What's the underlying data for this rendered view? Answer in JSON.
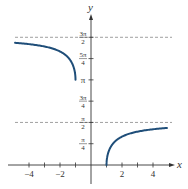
{
  "chart_data": {
    "type": "line",
    "title": "",
    "xlabel": "x",
    "ylabel": "y",
    "xlim": [
      -5.1,
      5.2
    ],
    "ylim": [
      0,
      5.1
    ],
    "grid": false,
    "x_ticks": [
      -4,
      -3,
      -2,
      -1,
      1,
      2,
      3,
      4
    ],
    "x_tick_labels": [
      {
        "value": -4,
        "text": "−4"
      },
      {
        "value": -2,
        "text": "−2"
      },
      {
        "value": 2,
        "text": "2"
      },
      {
        "value": 4,
        "text": "4"
      }
    ],
    "y_ticks": [
      {
        "value": 0.7854,
        "num": "π",
        "den": "4"
      },
      {
        "value": 1.5708,
        "num": "π",
        "den": "2"
      },
      {
        "value": 2.3562,
        "num": "3π",
        "den": "4"
      },
      {
        "value": 3.1416,
        "num": "π",
        "den": ""
      },
      {
        "value": 3.927,
        "num": "5π",
        "den": "4"
      },
      {
        "value": 4.7124,
        "num": "3π",
        "den": "2"
      }
    ],
    "asymptotes": [
      {
        "y": 4.7124,
        "label": "3π/2"
      },
      {
        "y": 1.5708,
        "label": "π/2"
      }
    ],
    "series": [
      {
        "name": "left branch (x ≤ −1)",
        "function": "2π − arccos(1/x)",
        "x_range": [
          -4.9,
          -1
        ],
        "points": [
          [
            -4.9,
            4.507
          ],
          [
            -4,
            4.459
          ],
          [
            -3,
            4.372
          ],
          [
            -2,
            4.189
          ],
          [
            -1.5,
            4.013
          ],
          [
            -1.2,
            3.728
          ],
          [
            -1.05,
            3.451
          ],
          [
            -1,
            3.1416
          ]
        ]
      },
      {
        "name": "right branch (x ≥ 1)",
        "function": "arccos(1/x)",
        "x_range": [
          1,
          4.9
        ],
        "points": [
          [
            1,
            0
          ],
          [
            1.05,
            0.309
          ],
          [
            1.2,
            0.586
          ],
          [
            1.5,
            0.841
          ],
          [
            2,
            1.047
          ],
          [
            3,
            1.231
          ],
          [
            4,
            1.318
          ],
          [
            4.9,
            1.365
          ]
        ]
      }
    ],
    "colors": {
      "curve": "#1f4e79",
      "asymptote": "#888888",
      "axis": "#333333"
    }
  }
}
